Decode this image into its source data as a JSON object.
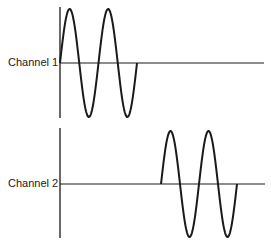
{
  "channels": [
    {
      "label": "Channel 1",
      "axis_x": 60,
      "axis_top": 7,
      "axis_bottom": 118,
      "baseline_y": 63,
      "baseline_end_x": 264,
      "wave_start_x": 60,
      "wave_cycles": 2,
      "period_px": 38.5,
      "amplitude_px": 54,
      "starting_phase": "rising"
    },
    {
      "label": "Channel 2",
      "axis_x": 60,
      "axis_top": 128,
      "axis_bottom": 238,
      "baseline_y": 184,
      "baseline_end_x": 265,
      "wave_start_x": 161,
      "wave_cycles": 2,
      "period_px": 38,
      "amplitude_px": 53,
      "starting_phase": "rising"
    }
  ],
  "colors": {
    "ink": "#1a1a1a",
    "background": "#ffffff"
  }
}
